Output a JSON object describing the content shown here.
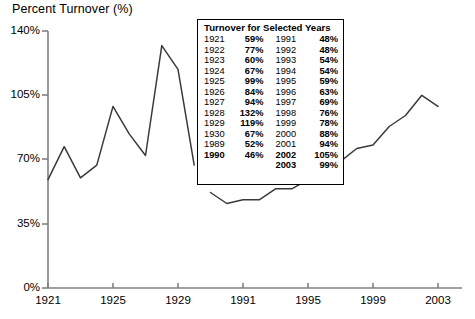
{
  "chart_data": {
    "type": "line",
    "title": "Percent Turnover (%)",
    "xlabel": "",
    "ylabel": "Percent Turnover (%)",
    "ylim": [
      0,
      140
    ],
    "yticks": [
      0,
      35,
      70,
      105,
      140
    ],
    "ytick_labels": [
      "0%",
      "35%",
      "70%",
      "105%",
      "140%"
    ],
    "xticks": [
      1921,
      1925,
      1929,
      1991,
      1995,
      1999,
      2003
    ],
    "xtick_labels": [
      "1921",
      "1925",
      "1929",
      "1991",
      "1995",
      "1999",
      "2003"
    ],
    "grid": false,
    "legend": "none",
    "axis_break": "x-axis is discontinuous between 1930 and 1989",
    "series": [
      {
        "name": "Turnover 1921-1930",
        "x": [
          1921,
          1922,
          1923,
          1924,
          1925,
          1926,
          1927,
          1928,
          1929,
          1930
        ],
        "values": [
          59,
          77,
          60,
          67,
          99,
          84,
          94,
          132,
          119,
          67
        ]
      },
      {
        "name": "Turnover 1989-2003",
        "x": [
          1989,
          1990,
          1991,
          1992,
          1993,
          1994,
          1995,
          1996,
          1997,
          1998,
          1999,
          2000,
          2001,
          2002,
          2003
        ],
        "values": [
          52,
          46,
          48,
          48,
          54,
          54,
          59,
          63,
          69,
          76,
          78,
          88,
          94,
          105,
          99
        ]
      }
    ]
  },
  "axis": {
    "title": "Percent Turnover (%)",
    "y_labels": [
      "140%",
      "105%",
      "70%",
      "35%",
      "0%"
    ],
    "x_labels": [
      "1921",
      "1925",
      "1929",
      "1991",
      "1995",
      "1999",
      "2003"
    ]
  },
  "table": {
    "header": "Turnover for Selected Years",
    "rows": [
      {
        "year_left": "1921",
        "value_left": "59%",
        "year_right": "1991",
        "value_right": "48%",
        "bold": false
      },
      {
        "year_left": "1922",
        "value_left": "77%",
        "year_right": "1992",
        "value_right": "48%",
        "bold": false
      },
      {
        "year_left": "1923",
        "value_left": "60%",
        "year_right": "1993",
        "value_right": "54%",
        "bold": false
      },
      {
        "year_left": "1924",
        "value_left": "67%",
        "year_right": "1994",
        "value_right": "54%",
        "bold": false
      },
      {
        "year_left": "1925",
        "value_left": "99%",
        "year_right": "1995",
        "value_right": "59%",
        "bold": false
      },
      {
        "year_left": "1926",
        "value_left": "84%",
        "year_right": "1996",
        "value_right": "63%",
        "bold": false
      },
      {
        "year_left": "1927",
        "value_left": "94%",
        "year_right": "1997",
        "value_right": "69%",
        "bold": false
      },
      {
        "year_left": "1928",
        "value_left": "132%",
        "year_right": "1998",
        "value_right": "76%",
        "bold": false
      },
      {
        "year_left": "1929",
        "value_left": "119%",
        "year_right": "1999",
        "value_right": "78%",
        "bold": false
      },
      {
        "year_left": "1930",
        "value_left": "67%",
        "year_right": "2000",
        "value_right": "88%",
        "bold": false
      },
      {
        "year_left": "1989",
        "value_left": "52%",
        "year_right": "2001",
        "value_right": "94%",
        "bold": false
      },
      {
        "year_left": "1990",
        "value_left": "46%",
        "year_right": "2002",
        "value_right": "105%",
        "bold": true
      },
      {
        "year_left": "",
        "value_left": "",
        "year_right": "2003",
        "value_right": "99%",
        "bold": true
      }
    ]
  },
  "colors": {
    "line": "#3a3a3a",
    "axis": "#808080",
    "text": "#000000",
    "background": "#ffffff",
    "table_border": "#000000"
  }
}
